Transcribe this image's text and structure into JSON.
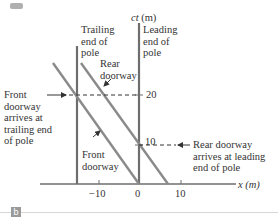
{
  "figure": {
    "panel_label": "b",
    "axes": {
      "y_label": "ct (m)",
      "x_label": "x (m)",
      "x_ticks": [
        "−10",
        "0",
        "10"
      ],
      "y_ticks": [
        "10",
        "20"
      ]
    },
    "labels": {
      "trailing_end": "Trailing\nend of\npole",
      "leading_end": "Leading\nend of\npole",
      "rear_doorway": "Rear\ndoorway",
      "front_doorway": "Front\ndoorway",
      "front_arrives": "Front\ndoorway\narrives at\ntrailing end\nof pole",
      "rear_arrives": "Rear doorway\narrives at leading\nend of pole"
    },
    "colors": {
      "axis": "#6e6e6e",
      "worldline": "#8a8a8a",
      "text": "#333333"
    }
  }
}
